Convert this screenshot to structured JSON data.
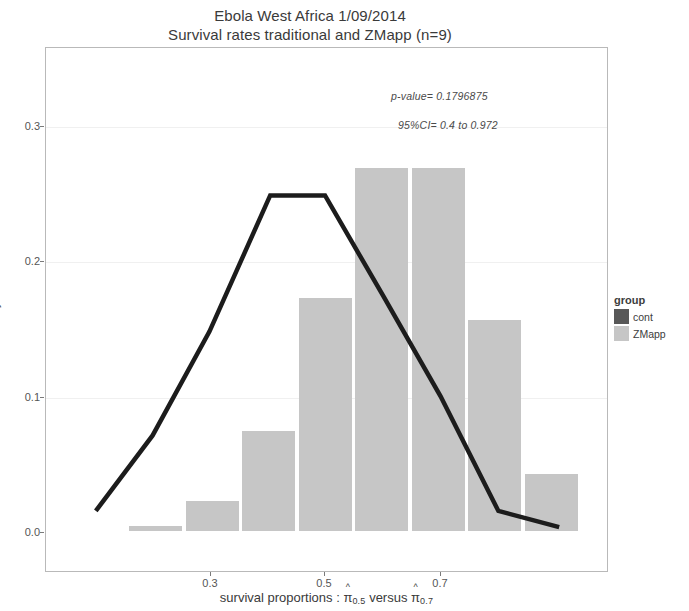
{
  "title": {
    "line1": "Ebola West Africa 1/09/2014",
    "line2": "Survival rates traditional and ZMapp (n=9)"
  },
  "annotations": {
    "p_value": "p-value=  0.1796875",
    "conf_int": "95%CI=  0.4 to 0.972"
  },
  "axes": {
    "x_title_prefix": "survival proportions :",
    "x_title_versus": "versus",
    "pi_symbol": "π",
    "hat_symbol": "^",
    "sub_low": "0.5",
    "sub_high": "0.7",
    "y_title": "Density"
  },
  "legend": {
    "title": "group",
    "items": [
      {
        "label": "cont",
        "color": "#585858"
      },
      {
        "label": "ZMapp",
        "color": "#c6c6c6"
      }
    ]
  },
  "chart_data": {
    "type": "bar",
    "xlabel": "survival proportions : pi-hat_0.5 versus pi-hat_0.7",
    "ylabel": "Density",
    "xlim": [
      0.15,
      0.95
    ],
    "ylim": [
      0.0,
      0.312
    ],
    "x_ticks": [
      0.3,
      0.5,
      0.7
    ],
    "x_tick_labels": [
      "0.3",
      "0.5",
      "0.7"
    ],
    "y_ticks": [
      0.0,
      0.1,
      0.2,
      0.3
    ],
    "y_tick_labels": [
      "0.0",
      "0.1",
      "0.2",
      "0.3"
    ],
    "grid": true,
    "legend_position": "right",
    "series": [
      {
        "name": "ZMapp",
        "type": "bar",
        "color": "#c6c6c6",
        "bin_centers": [
          0.2,
          0.25,
          0.3,
          0.35,
          0.4,
          0.45,
          0.5,
          0.55
        ],
        "bin_left_px": [
          128,
          185,
          241,
          298,
          354,
          411,
          467,
          524
        ],
        "bin_width_px": 53,
        "values": [
          0.004,
          0.022,
          0.074,
          0.172,
          0.268,
          0.268,
          0.156,
          0.042
        ]
      },
      {
        "name": "cont",
        "type": "line",
        "color": "#1c1c1c",
        "x_px": [
          95,
          152,
          209,
          270,
          325,
          383,
          441,
          499,
          560
        ],
        "values": [
          0.015,
          0.071,
          0.148,
          0.249,
          0.249,
          0.175,
          0.1,
          0.015,
          0.003
        ]
      }
    ]
  }
}
